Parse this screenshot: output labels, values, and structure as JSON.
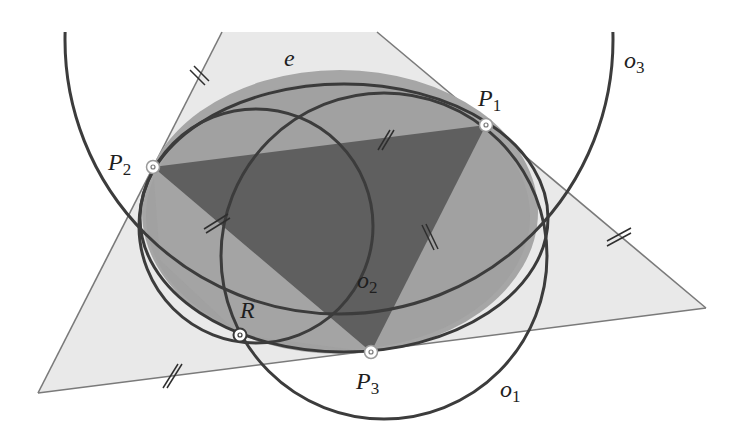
{
  "figure": {
    "colors": {
      "background": "#ffffff",
      "outer_triangle_fill": "#e9e9e9",
      "outer_triangle_stroke": "#7a7a7a",
      "ellipse_e_fill": "#a3a3a3",
      "ellipse_e_inner_fill": "#9c9c9c",
      "inner_triangle_fill": "#5e5e5e",
      "curve_stroke": "#3c3c3c",
      "point_ring": "#ffffff"
    },
    "labels": {
      "e": "e",
      "P1": "P",
      "P1_sub": "1",
      "P2": "P",
      "P2_sub": "2",
      "P3": "P",
      "P3_sub": "3",
      "R": "R",
      "o1": "o",
      "o1_sub": "1",
      "o2": "o",
      "o2_sub": "2",
      "o3": "o",
      "o3_sub": "3"
    },
    "points": [
      {
        "name": "P1",
        "x": 486,
        "y": 125
      },
      {
        "name": "P2",
        "x": 153,
        "y": 167
      },
      {
        "name": "P3",
        "x": 371,
        "y": 352
      },
      {
        "name": "R",
        "x": 240,
        "y": 335
      }
    ],
    "curves": [
      {
        "name": "e",
        "type": "ellipse"
      },
      {
        "name": "o1",
        "type": "circle"
      },
      {
        "name": "o2",
        "type": "circle"
      },
      {
        "name": "o3",
        "type": "circle"
      }
    ],
    "tick_marks": "double-tick congruence marks on tangent-triangle sides and inner-triangle sides"
  }
}
